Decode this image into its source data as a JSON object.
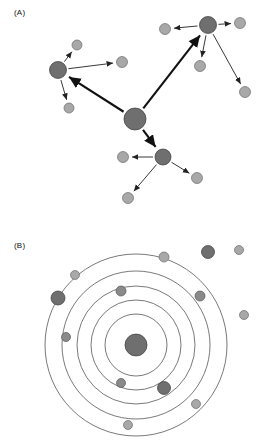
{
  "figure": {
    "panels": [
      {
        "id": "panel-a",
        "label": "(A)",
        "type": "hub-and-spoke-network",
        "description": "Hierarchical network: one large central hub connected by thick arrows to three secondary hubs, each of which connects by thin arrows to small peripheral nodes."
      },
      {
        "id": "panel-b",
        "label": "(B)",
        "type": "concentric-ring-diagram",
        "description": "Five concentric circles around a central hub node, with small nodes placed on and between rings and several nodes outside the outermost ring."
      }
    ]
  },
  "chart_data": [
    {
      "type": "scatter",
      "id": "panel-a-network",
      "title": "(A)",
      "xlabel": "",
      "ylabel": "",
      "xlim": [
        0,
        268
      ],
      "ylim": [
        0,
        223
      ],
      "grid": false,
      "legend": "none",
      "colors": {
        "hub_fill": "#6f6f6f",
        "leaf_fill": "#a8a8a8",
        "edge": "#111111",
        "background": "#ffffff"
      },
      "nodes": [
        {
          "id": "center",
          "x": 135,
          "y": 119,
          "r": 11,
          "kind": "hub"
        },
        {
          "id": "hub-left",
          "x": 58,
          "y": 70,
          "r": 8.5,
          "kind": "hub"
        },
        {
          "id": "hub-top-right",
          "x": 208,
          "y": 25,
          "r": 8.5,
          "kind": "hub"
        },
        {
          "id": "hub-bottom",
          "x": 163,
          "y": 157,
          "r": 8.0,
          "kind": "hub"
        },
        {
          "id": "leaf-l1",
          "x": 77,
          "y": 45,
          "r": 5.0,
          "kind": "leaf"
        },
        {
          "id": "leaf-l2",
          "x": 122,
          "y": 62,
          "r": 5.5,
          "kind": "leaf"
        },
        {
          "id": "leaf-l3",
          "x": 69,
          "y": 108,
          "r": 5.0,
          "kind": "leaf"
        },
        {
          "id": "leaf-t1",
          "x": 165,
          "y": 29,
          "r": 5.5,
          "kind": "leaf"
        },
        {
          "id": "leaf-t2",
          "x": 240,
          "y": 23,
          "r": 5.5,
          "kind": "leaf"
        },
        {
          "id": "leaf-t3",
          "x": 200,
          "y": 66,
          "r": 5.5,
          "kind": "leaf"
        },
        {
          "id": "leaf-t4",
          "x": 245,
          "y": 92,
          "r": 5.5,
          "kind": "leaf"
        },
        {
          "id": "leaf-b1",
          "x": 123,
          "y": 157,
          "r": 5.5,
          "kind": "leaf"
        },
        {
          "id": "leaf-b2",
          "x": 197,
          "y": 178,
          "r": 5.5,
          "kind": "leaf"
        },
        {
          "id": "leaf-b3",
          "x": 128,
          "y": 198,
          "r": 5.5,
          "kind": "leaf"
        }
      ],
      "edges": [
        {
          "from": "center",
          "to": "hub-left",
          "weight": "major"
        },
        {
          "from": "center",
          "to": "hub-top-right",
          "weight": "major"
        },
        {
          "from": "center",
          "to": "hub-bottom",
          "weight": "major"
        },
        {
          "from": "hub-left",
          "to": "leaf-l1",
          "weight": "minor"
        },
        {
          "from": "hub-left",
          "to": "leaf-l2",
          "weight": "minor"
        },
        {
          "from": "hub-left",
          "to": "leaf-l3",
          "weight": "minor"
        },
        {
          "from": "hub-top-right",
          "to": "leaf-t1",
          "weight": "minor"
        },
        {
          "from": "hub-top-right",
          "to": "leaf-t2",
          "weight": "minor"
        },
        {
          "from": "hub-top-right",
          "to": "leaf-t3",
          "weight": "minor"
        },
        {
          "from": "hub-top-right",
          "to": "leaf-t4",
          "weight": "minor"
        },
        {
          "from": "hub-bottom",
          "to": "leaf-b1",
          "weight": "minor"
        },
        {
          "from": "hub-bottom",
          "to": "leaf-b2",
          "weight": "minor"
        },
        {
          "from": "hub-bottom",
          "to": "leaf-b3",
          "weight": "minor"
        }
      ]
    },
    {
      "type": "scatter",
      "id": "panel-b-rings",
      "title": "(B)",
      "xlabel": "",
      "ylabel": "",
      "xlim": [
        0,
        268
      ],
      "ylim": [
        0,
        223
      ],
      "grid": false,
      "legend": "none",
      "colors": {
        "hub_fill": "#6f6f6f",
        "leaf_fill": "#a8a8a8",
        "ring_stroke": "#3f3f3f",
        "background": "#ffffff"
      },
      "ring_center": {
        "x": 136,
        "y": 122
      },
      "ring_radii": [
        31,
        45,
        59,
        74,
        91
      ],
      "ring_count": 5,
      "nodes": [
        {
          "id": "b-center",
          "x": 136,
          "y": 122,
          "r": 11,
          "kind": "hub"
        },
        {
          "id": "b-n1",
          "x": 208,
          "y": 29,
          "r": 6.5,
          "kind": "hub"
        },
        {
          "id": "b-n2",
          "x": 239,
          "y": 27,
          "r": 4.5,
          "kind": "leaf"
        },
        {
          "id": "b-n3",
          "x": 164,
          "y": 34,
          "r": 5.0,
          "kind": "leaf"
        },
        {
          "id": "b-n4",
          "x": 75,
          "y": 52,
          "r": 4.5,
          "kind": "leaf"
        },
        {
          "id": "b-n5",
          "x": 58,
          "y": 75,
          "r": 7.0,
          "kind": "hub"
        },
        {
          "id": "b-n6",
          "x": 121,
          "y": 68,
          "r": 5.0,
          "kind": "mid"
        },
        {
          "id": "b-n7",
          "x": 200,
          "y": 73,
          "r": 5.0,
          "kind": "mid"
        },
        {
          "id": "b-n8",
          "x": 66,
          "y": 114,
          "r": 4.5,
          "kind": "mid"
        },
        {
          "id": "b-n9",
          "x": 244,
          "y": 92,
          "r": 4.5,
          "kind": "leaf"
        },
        {
          "id": "b-n10",
          "x": 121,
          "y": 160,
          "r": 4.5,
          "kind": "mid"
        },
        {
          "id": "b-n11",
          "x": 164,
          "y": 165,
          "r": 6.5,
          "kind": "hub"
        },
        {
          "id": "b-n12",
          "x": 196,
          "y": 181,
          "r": 4.5,
          "kind": "leaf"
        },
        {
          "id": "b-n13",
          "x": 128,
          "y": 202,
          "r": 4.5,
          "kind": "leaf"
        }
      ]
    }
  ]
}
